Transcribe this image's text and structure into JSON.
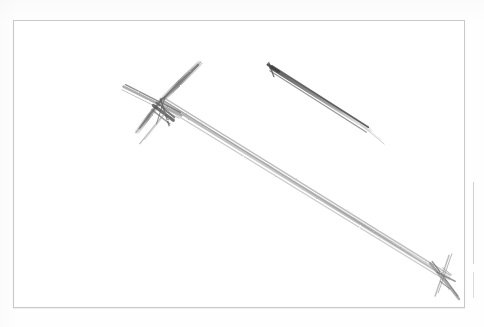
{
  "page": {
    "background_color": "#fefefe",
    "paper_color": "#ffffff",
    "frame_border_color": "#c9c9c9"
  },
  "figure": {
    "frame_label": "figure-frame",
    "caption": "",
    "medium": "graphite pencil sketch",
    "graphite_color": "#8a8a8a",
    "graphite_dark_color": "#4a4a4a"
  },
  "drawing": {
    "subjects": [
      {
        "name": "long-sword",
        "parts": [
          "blade",
          "crossguard",
          "grip",
          "pommel"
        ],
        "orientation": "diagonal, hilt upper-left, point lower-right"
      },
      {
        "name": "short-blade",
        "parts": [
          "blade",
          "tang"
        ],
        "orientation": "diagonal, thick end upper-left, tip lower-right"
      }
    ]
  },
  "margin": {
    "rule_color": "#d0d0d0"
  }
}
